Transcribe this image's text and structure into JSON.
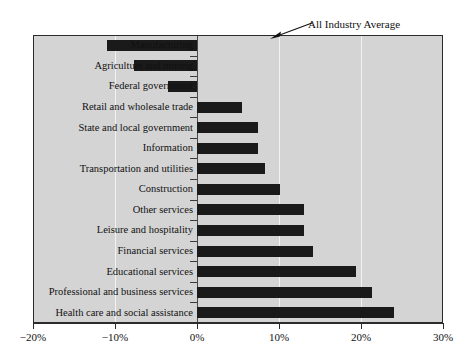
{
  "chart_data": {
    "type": "bar",
    "orientation": "horizontal",
    "title": "",
    "subtitle": "",
    "xlabel": "",
    "ylabel": "",
    "xlim": [
      -20,
      30
    ],
    "ylim": null,
    "grid": true,
    "gridlines_at": [
      -20,
      -10,
      0,
      10,
      20,
      30
    ],
    "legend": null,
    "legend_position": "none",
    "xtick_labels": [
      "−20%",
      "−10%",
      "0%",
      "10%",
      "20%",
      "30%"
    ],
    "xtick_values": [
      -20,
      -10,
      0,
      10,
      20,
      30
    ],
    "categories": [
      "Manufacturing",
      "Agriculture and mining",
      "Federal government",
      "Retail and wholesale trade",
      "State and local government",
      "Information",
      "Transportation and utilities",
      "Construction",
      "Other services",
      "Leisure and hospitality",
      "Financial services",
      "Educational services",
      "Professional and business services",
      "Health care and social assistance"
    ],
    "values": [
      -11.0,
      -7.7,
      -3.5,
      5.5,
      7.4,
      7.4,
      8.3,
      10.1,
      13.0,
      13.0,
      14.1,
      19.4,
      21.3,
      24.0
    ],
    "annotations": [
      {
        "text": "All Industry Average",
        "points_to_value": 10,
        "style": "arrow"
      }
    ],
    "colors": {
      "bar": "#1a1a1a",
      "plot_background": "#d4d4d4",
      "gridline": "#f2f2f2",
      "zero_axis": "#4a4a4a",
      "frame": "#2b2b2b",
      "text": "#111111",
      "page_background": "#ffffff"
    }
  }
}
